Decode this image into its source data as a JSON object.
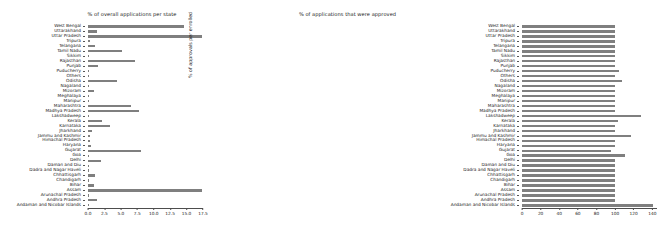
{
  "figure": {
    "y_axis_caption": "% of approvals per enrolled"
  },
  "panels": [
    {
      "id": "left",
      "title": "% of overall applications per state"
    },
    {
      "id": "right",
      "title": "% of applications that were approved"
    }
  ],
  "chart_data": [
    {
      "type": "bar",
      "orientation": "horizontal",
      "title": "% of overall applications per state",
      "xlabel": "",
      "ylabel": "% of approvals per enrolled",
      "xlim": [
        0,
        17.5
      ],
      "xticks": [
        "0.0",
        "2.5",
        "5.0",
        "7.5",
        "10.0",
        "12.5",
        "15.0",
        "17.5"
      ],
      "grid": false,
      "bar_color": "#7f7f7f",
      "categories": [
        "West Bengal",
        "Uttarakhand",
        "Uttar Pradesh",
        "Tripura",
        "Telangana",
        "Tamil Nadu",
        "Sikkim",
        "Rajasthan",
        "Punjab",
        "Puducherry",
        "Others",
        "Odisha",
        "Nagaland",
        "Mizoram",
        "Meghalaya",
        "Manipur",
        "Maharashtra",
        "Madhya Pradesh",
        "Lakshadweep",
        "Kerala",
        "Karnataka",
        "Jharkhand",
        "Jammu and Kashmir",
        "Himachal Pradesh",
        "Haryana",
        "Gujarat",
        "Goa",
        "Delhi",
        "Daman and Diu",
        "Dadra and Nagar Haveli",
        "Chhattisgarh",
        "Chandigarh",
        "Bihar",
        "Assam",
        "Arunachal Pradesh",
        "Andhra Pradesh",
        "Andaman and Nicobar Islands"
      ],
      "values": [
        14.6,
        1.3,
        17.4,
        0.25,
        1.1,
        5.2,
        0.12,
        7.2,
        1.5,
        0.08,
        0.1,
        4.4,
        0.1,
        0.9,
        0.1,
        0.15,
        6.6,
        7.8,
        0.05,
        2.2,
        3.3,
        0.55,
        0.35,
        0.3,
        0.45,
        8.0,
        0.1,
        2.0,
        0.05,
        0.05,
        1.1,
        0.1,
        0.9,
        17.3,
        0.2,
        1.3,
        0.05
      ]
    },
    {
      "type": "bar",
      "orientation": "horizontal",
      "title": "% of applications that were approved",
      "xlabel": "",
      "ylabel": "",
      "xlim": [
        0,
        145
      ],
      "xticks": [
        "0",
        "20",
        "40",
        "60",
        "80",
        "100",
        "120",
        "140"
      ],
      "grid": false,
      "bar_color": "#7f7f7f",
      "categories": [
        "West Bengal",
        "Uttarakhand",
        "Uttar Pradesh",
        "Tripura",
        "Telangana",
        "Tamil Nadu",
        "Sikkim",
        "Rajasthan",
        "Punjab",
        "Puducherry",
        "Others",
        "Odisha",
        "Nagaland",
        "Mizoram",
        "Meghalaya",
        "Manipur",
        "Maharashtra",
        "Madhya Pradesh",
        "Lakshadweep",
        "Kerala",
        "Karnataka",
        "Jharkhand",
        "Jammu and Kashmir",
        "Himachal Pradesh",
        "Haryana",
        "Gujarat",
        "Goa",
        "Delhi",
        "Daman and Diu",
        "Dadra and Nagar Haveli",
        "Chhattisgarh",
        "Chandigarh",
        "Bihar",
        "Assam",
        "Arunachal Pradesh",
        "Andhra Pradesh",
        "Andaman and Nicobar Islands"
      ],
      "values": [
        100,
        100,
        100,
        100,
        100,
        100,
        100,
        100,
        100,
        104,
        100,
        107,
        100,
        100,
        100,
        100,
        100,
        100,
        128,
        103,
        100,
        100,
        117,
        100,
        100,
        96,
        111,
        100,
        100,
        100,
        100,
        100,
        100,
        100,
        100,
        100,
        141
      ]
    }
  ]
}
